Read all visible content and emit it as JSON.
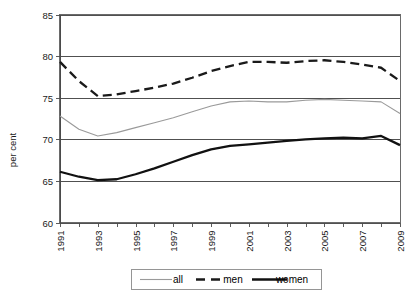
{
  "chart_data": {
    "type": "line",
    "title": "",
    "xlabel": "",
    "ylabel": "per cent",
    "ylim": [
      60,
      85
    ],
    "ytick_values": [
      60,
      65,
      70,
      75,
      80,
      85
    ],
    "ytick_labels": [
      "60",
      "65",
      "70",
      "75",
      "80",
      "85"
    ],
    "xlim": [
      1991,
      2009
    ],
    "x": [
      1991,
      1992,
      1993,
      1994,
      1995,
      1996,
      1997,
      1998,
      1999,
      2000,
      2001,
      2002,
      2003,
      2004,
      2005,
      2006,
      2007,
      2008,
      2009
    ],
    "xtick_values": [
      1991,
      1992,
      1993,
      1994,
      1995,
      1996,
      1997,
      1998,
      1999,
      2000,
      2001,
      2002,
      2003,
      2004,
      2005,
      2006,
      2007,
      2008,
      2009
    ],
    "xtick_labels": [
      "1991",
      "",
      "1993",
      "",
      "1995",
      "",
      "1997",
      "",
      "1999",
      "",
      "2001",
      "",
      "2003",
      "",
      "2005",
      "",
      "2007",
      "",
      "2009"
    ],
    "grid": true,
    "grid_axis": "y",
    "legend_position": "bottom",
    "series": [
      {
        "name": "all",
        "color": "#9a9a9a",
        "style": "solid",
        "width": 1.1,
        "values": [
          72.8,
          71.2,
          70.4,
          70.8,
          71.4,
          72.0,
          72.6,
          73.3,
          74.0,
          74.5,
          74.6,
          74.5,
          74.5,
          74.7,
          74.8,
          74.7,
          74.6,
          74.5,
          73.1
        ]
      },
      {
        "name": "men",
        "color": "#1a1a1a",
        "style": "dashed",
        "width": 2.3,
        "values": [
          79.3,
          77.0,
          75.2,
          75.4,
          75.8,
          76.2,
          76.7,
          77.4,
          78.2,
          78.8,
          79.3,
          79.3,
          79.2,
          79.4,
          79.5,
          79.3,
          79.0,
          78.6,
          77.0
        ]
      },
      {
        "name": "women",
        "color": "#111111",
        "style": "solid",
        "width": 2.3,
        "values": [
          66.1,
          65.5,
          65.1,
          65.2,
          65.8,
          66.5,
          67.3,
          68.1,
          68.8,
          69.2,
          69.4,
          69.6,
          69.8,
          70.0,
          70.1,
          70.2,
          70.1,
          70.4,
          69.3
        ]
      }
    ]
  },
  "legend": {
    "items": [
      {
        "label": "all"
      },
      {
        "label": "men"
      },
      {
        "label": "women"
      }
    ]
  },
  "axes": {
    "y_title": "per cent"
  }
}
